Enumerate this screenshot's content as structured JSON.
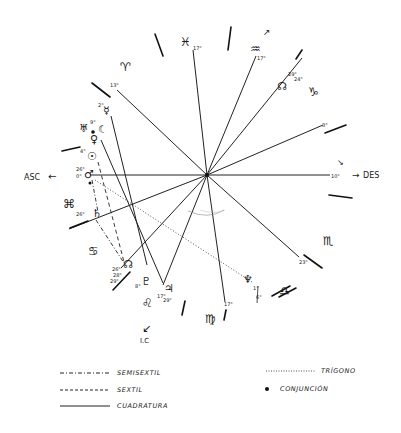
{
  "chart": {
    "type": "natal-chart",
    "center": {
      "x": 207,
      "y": 175
    },
    "angles": {
      "asc_label": "ASC",
      "des_label": "DES",
      "ic_label": "I.C",
      "asc_arrow": "←",
      "des_arrow": "→",
      "ic_arrow": "↙"
    },
    "signs": [
      {
        "name": "aries",
        "glyph": "♈",
        "x": 126,
        "y": 66
      },
      {
        "name": "pisces",
        "glyph": "♓",
        "x": 185,
        "y": 43
      },
      {
        "name": "aquarius",
        "glyph": "♒",
        "x": 259,
        "y": 49
      },
      {
        "name": "capricorn",
        "glyph": "♑",
        "x": 315,
        "y": 90
      },
      {
        "name": "scorpio",
        "glyph": "♏",
        "x": 330,
        "y": 240
      },
      {
        "name": "libra",
        "glyph": "♎",
        "x": 286,
        "y": 292
      },
      {
        "name": "virgo",
        "glyph": "♍",
        "x": 212,
        "y": 320
      },
      {
        "name": "leo",
        "glyph": "♌",
        "x": 149,
        "y": 303
      },
      {
        "name": "cancer",
        "glyph": "♋",
        "x": 95,
        "y": 250
      },
      {
        "name": "gemini",
        "glyph": "⌘",
        "x": 70,
        "y": 204
      }
    ],
    "cusp_degrees": [
      {
        "label": "17°",
        "x": 193,
        "y": 48
      },
      {
        "label": "17°",
        "x": 259,
        "y": 58
      },
      {
        "label": "3°",
        "x": 324,
        "y": 126
      },
      {
        "label": "10°",
        "x": 331,
        "y": 176
      },
      {
        "label": "23°",
        "x": 299,
        "y": 262
      },
      {
        "label": "17°",
        "x": 224,
        "y": 304
      },
      {
        "label": "6°",
        "x": 256,
        "y": 297
      },
      {
        "label": "13°",
        "x": 110,
        "y": 85
      }
    ],
    "planets": [
      {
        "name": "mercury",
        "glyph": "☿",
        "degree": "2°",
        "x": 109,
        "y": 108
      },
      {
        "name": "uranus",
        "glyph": "♅",
        "degree": "",
        "x": 85,
        "y": 128
      },
      {
        "name": "moon",
        "glyph": "☾",
        "degree": "9°",
        "x": 104,
        "y": 128
      },
      {
        "name": "venus",
        "glyph": "♀",
        "degree": "",
        "x": 95,
        "y": 138
      },
      {
        "name": "sun",
        "glyph": "☉",
        "degree": "4°",
        "x": 92,
        "y": 155
      },
      {
        "name": "mars",
        "glyph": "♂",
        "degree": "26°",
        "x": 90,
        "y": 173
      },
      {
        "name": "saturn",
        "glyph": "♄",
        "degree": "26°",
        "x": 97,
        "y": 213
      },
      {
        "name": "north-node",
        "glyph": "☊",
        "degree": "26°",
        "x": 131,
        "y": 264
      },
      {
        "name": "pluto",
        "glyph": "♇",
        "degree": "8°",
        "x": 146,
        "y": 281
      },
      {
        "name": "jupiter",
        "glyph": "♃",
        "degree": "17°",
        "x": 169,
        "y": 287
      },
      {
        "name": "neptune",
        "glyph": "♆",
        "degree": "1°",
        "x": 248,
        "y": 278
      },
      {
        "name": "north-node-2",
        "glyph": "☊",
        "degree": "29°",
        "x": 289,
        "y": 85
      }
    ],
    "extra_degrees": [
      {
        "label": "29°",
        "x": 291,
        "y": 75
      },
      {
        "label": "24°",
        "x": 296,
        "y": 80
      },
      {
        "label": "26°",
        "x": 75,
        "y": 216
      },
      {
        "label": "26°",
        "x": 116,
        "y": 275
      },
      {
        "label": "28°",
        "x": 116,
        "y": 281
      },
      {
        "label": "29°",
        "x": 113,
        "y": 287
      },
      {
        "label": "17°",
        "x": 160,
        "y": 299
      },
      {
        "label": "29°",
        "x": 168,
        "y": 302
      },
      {
        "label": "8°",
        "x": 135,
        "y": 287
      },
      {
        "label": "4°",
        "x": 78,
        "y": 155
      },
      {
        "label": "5°",
        "x": 78,
        "y": 172
      },
      {
        "label": "0°",
        "x": 78,
        "y": 178
      }
    ]
  },
  "legend": {
    "items": [
      {
        "key": "semisextil",
        "label": "SEMISEXTIL",
        "style": "dash-dot"
      },
      {
        "key": "sextil",
        "label": "SEXTIL",
        "style": "dashed"
      },
      {
        "key": "cuadratura",
        "label": "CUADRATURA",
        "style": "solid"
      },
      {
        "key": "trigono",
        "label": "TRÍGONO",
        "style": "dotted"
      },
      {
        "key": "conjuncion",
        "label": "CONJUNCIÓN",
        "style": "dot"
      }
    ]
  }
}
